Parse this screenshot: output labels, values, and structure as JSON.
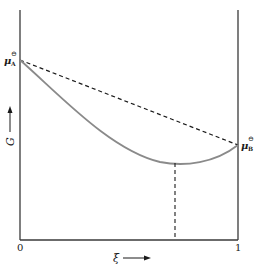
{
  "diagram": {
    "type": "gibbs-energy-vs-extent-of-reaction",
    "axes": {
      "y_label": "G",
      "x_label": "ξ",
      "x_tick_start": "0",
      "x_tick_end": "1"
    },
    "points": {
      "left": {
        "symbol": "μ",
        "subscript": "A",
        "superscript": "⊖"
      },
      "right": {
        "symbol": "μ",
        "subscript": "B",
        "superscript": "⊖"
      }
    },
    "curves": {
      "gibbs_curve": {
        "style": "solid",
        "color": "#8a8a8a"
      },
      "ideal_line": {
        "style": "dashed",
        "color": "#1a1a1a"
      },
      "equilibrium_marker": {
        "style": "dashed",
        "color": "#1a1a1a"
      }
    },
    "colors": {
      "axis": "#3a3a3a",
      "curve": "#8a8a8a",
      "text": "#1a1a1a"
    }
  }
}
